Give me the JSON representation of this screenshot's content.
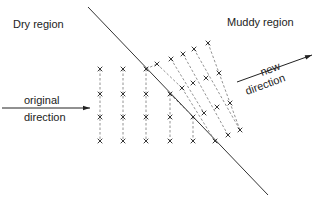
{
  "labels": {
    "dry_region": "Dry region",
    "muddy_region": "Muddy region",
    "original_line1": "original",
    "original_line2": "direction",
    "new_line1": "new",
    "new_line2": "direction"
  },
  "boundary": {
    "x1": 88,
    "y1": 7,
    "x2": 268,
    "y2": 195
  },
  "original_arrow": {
    "x1": 2,
    "y1": 108,
    "x2": 90,
    "y2": 108
  },
  "new_arrow": {
    "x1": 237,
    "y1": 82,
    "x2": 312,
    "y2": 55
  },
  "vertical_tracks": [
    {
      "x": 100,
      "y1": 69,
      "y2": 141
    },
    {
      "x": 123,
      "y1": 69,
      "y2": 141
    },
    {
      "x": 146,
      "y1": 69,
      "y2": 141
    },
    {
      "x": 170,
      "y1": 94,
      "y2": 141
    },
    {
      "x": 193,
      "y1": 117,
      "y2": 141
    }
  ],
  "slanted_tracks": [
    {
      "x1": 146,
      "y1": 69,
      "x2": 157,
      "y2": 64
    },
    {
      "x1": 157,
      "y1": 64,
      "x2": 182,
      "y2": 88
    },
    {
      "x1": 171,
      "y1": 59,
      "x2": 204,
      "y2": 113
    },
    {
      "x1": 183,
      "y1": 54,
      "x2": 228,
      "y2": 135
    },
    {
      "x1": 194,
      "y1": 49,
      "x2": 240,
      "y2": 130
    },
    {
      "x1": 208,
      "y1": 43,
      "x2": 240,
      "y2": 130
    },
    {
      "x1": 170,
      "y1": 94,
      "x2": 193,
      "y2": 117
    },
    {
      "x1": 182,
      "y1": 88,
      "x2": 215,
      "y2": 141
    }
  ],
  "marks": [
    [
      100,
      69
    ],
    [
      100,
      94
    ],
    [
      100,
      117
    ],
    [
      100,
      141
    ],
    [
      123,
      69
    ],
    [
      123,
      94
    ],
    [
      123,
      117
    ],
    [
      123,
      141
    ],
    [
      146,
      69
    ],
    [
      146,
      94
    ],
    [
      146,
      117
    ],
    [
      146,
      141
    ],
    [
      170,
      94
    ],
    [
      170,
      117
    ],
    [
      170,
      141
    ],
    [
      193,
      117
    ],
    [
      193,
      141
    ],
    [
      215,
      141
    ],
    [
      157,
      64
    ],
    [
      171,
      59
    ],
    [
      183,
      54
    ],
    [
      194,
      49
    ],
    [
      208,
      43
    ],
    [
      182,
      88
    ],
    [
      193,
      83
    ],
    [
      206,
      78
    ],
    [
      219,
      73
    ],
    [
      204,
      113
    ],
    [
      217,
      107
    ],
    [
      230,
      103
    ],
    [
      228,
      135
    ],
    [
      240,
      130
    ]
  ]
}
